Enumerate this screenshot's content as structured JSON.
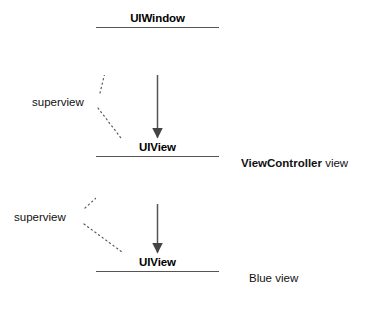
{
  "diagram": {
    "type": "uml-view-hierarchy",
    "background_color": "#ffffff",
    "stroke_color": "#555555",
    "text_color": "#111111",
    "boxes": [
      {
        "id": "uiwindow",
        "title": "UIWindow",
        "x": 96,
        "y": 10,
        "width": 123,
        "height": 47
      },
      {
        "id": "uiview-controller",
        "title": "UIView",
        "x": 96,
        "y": 139,
        "width": 123,
        "height": 47
      },
      {
        "id": "uiview-blue",
        "title": "UIView",
        "x": 96,
        "y": 254,
        "width": 123,
        "height": 47
      }
    ],
    "annotations": {
      "viewcontroller_view": {
        "bold_text": "ViewController",
        "plain_text": " view"
      },
      "blue_view": {
        "text": "Blue view"
      }
    },
    "superview_labels": [
      {
        "id": "superview-1",
        "text": "superview"
      },
      {
        "id": "superview-2",
        "text": "superview"
      }
    ],
    "arrows": [
      {
        "id": "window-to-view",
        "kind": "solid-filled-arrow",
        "from": "uiwindow",
        "to": "uiview-controller"
      },
      {
        "id": "view-to-blue",
        "kind": "solid-filled-arrow",
        "from": "uiview-controller",
        "to": "uiview-blue"
      },
      {
        "id": "superview-1-up",
        "kind": "dotted-filled-arrow",
        "from": "superview-1",
        "to": "uiwindow"
      },
      {
        "id": "superview-1-down",
        "kind": "dotted-leader",
        "from": "superview-1",
        "to": "uiview-controller"
      },
      {
        "id": "superview-2-up",
        "kind": "dotted-filled-arrow",
        "from": "superview-2",
        "to": "uiview-controller"
      },
      {
        "id": "superview-2-down",
        "kind": "dotted-leader",
        "from": "superview-2",
        "to": "uiview-blue"
      }
    ]
  }
}
